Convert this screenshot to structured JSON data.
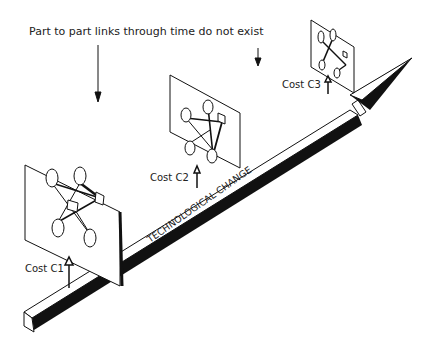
{
  "diagram": {
    "title_note": "Part to part links through time do not exist",
    "axis_label": "TECHNOLOGICAL CHANGE",
    "costs": [
      {
        "label": "Cost C1"
      },
      {
        "label": "Cost C2"
      },
      {
        "label": "Cost C3"
      }
    ],
    "colors": {
      "ink": "#111111",
      "background": "#ffffff"
    }
  }
}
